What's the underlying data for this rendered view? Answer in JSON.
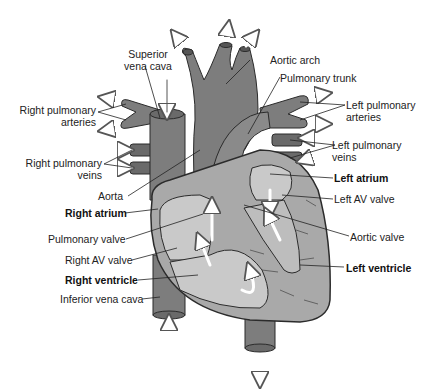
{
  "diagram": {
    "type": "anatomical-heart-cross-section",
    "colors": {
      "vessel": "#7d7d7d",
      "vessel_dark": "#6a6a6a",
      "chamber_fill": "#c9c9c9",
      "myocardium": "#a9a9a9",
      "outline": "#2b2b2b",
      "arrow_fill": "#ffffff",
      "background": "#ffffff"
    },
    "labels": {
      "superior_vena_cava_1": "Superior",
      "superior_vena_cava_2": "vena cava",
      "aortic_arch": "Aortic arch",
      "pulmonary_trunk": "Pulmonary trunk",
      "right_pulmonary_arteries_1": "Right pulmonary",
      "right_pulmonary_arteries_2": "arteries",
      "left_pulmonary_arteries_1": "Left pulmonary",
      "left_pulmonary_arteries_2": "arteries",
      "right_pulmonary_veins_1": "Right pulmonary",
      "right_pulmonary_veins_2": "veins",
      "left_pulmonary_veins_1": "Left pulmonary",
      "left_pulmonary_veins_2": "veins",
      "aorta": "Aorta",
      "left_atrium": "Left atrium",
      "left_av_valve": "Left AV valve",
      "right_atrium": "Right atrium",
      "pulmonary_valve": "Pulmonary valve",
      "aortic_valve": "Aortic valve",
      "right_av_valve": "Right AV valve",
      "right_ventricle": "Right ventricle",
      "left_ventricle": "Left ventricle",
      "inferior_vena_cava": "Inferior vena cava"
    }
  }
}
